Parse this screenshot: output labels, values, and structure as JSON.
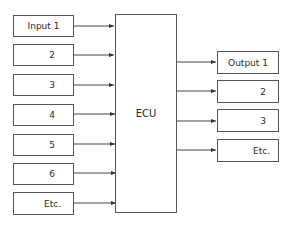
{
  "diagram": {
    "center": {
      "label": "ECU"
    },
    "inputs": [
      {
        "label": "Input 1"
      },
      {
        "label": "2"
      },
      {
        "label": "3"
      },
      {
        "label": "4"
      },
      {
        "label": "5"
      },
      {
        "label": "6"
      },
      {
        "label": "Etc."
      }
    ],
    "outputs": [
      {
        "label": "Output 1"
      },
      {
        "label": "2"
      },
      {
        "label": "3"
      },
      {
        "label": "Etc."
      }
    ],
    "colors": {
      "stroke": "#555555",
      "text": "#2a2a2a",
      "background": "#ffffff"
    }
  }
}
